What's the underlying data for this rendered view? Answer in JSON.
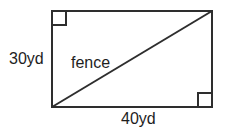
{
  "figure": {
    "name": "rectangle-with-diagonal-fence",
    "background_color": "#ffffff",
    "stroke_color": "#2e2e2e",
    "stroke_width": 2,
    "text_color": "#1e1e1e"
  },
  "labels": {
    "height": "30yd",
    "diagonal": "fence",
    "width": "40yd"
  },
  "shape": {
    "type": "rectangle",
    "left": 52,
    "top": 11,
    "right": 212,
    "bottom": 107,
    "pixel_width": 160,
    "pixel_height": 96
  },
  "diagonal": {
    "type": "line",
    "from": {
      "x": 52,
      "y": 107
    },
    "to": {
      "x": 212,
      "y": 11
    }
  },
  "right_angle_markers": [
    {
      "position": "top-left",
      "x": 52,
      "y": 11,
      "size": 14
    },
    {
      "position": "bottom-right",
      "x": 212,
      "y": 107,
      "size": 14
    }
  ],
  "measurements": {
    "height_value": 30,
    "height_unit": "yd",
    "width_value": 40,
    "width_unit": "yd"
  }
}
